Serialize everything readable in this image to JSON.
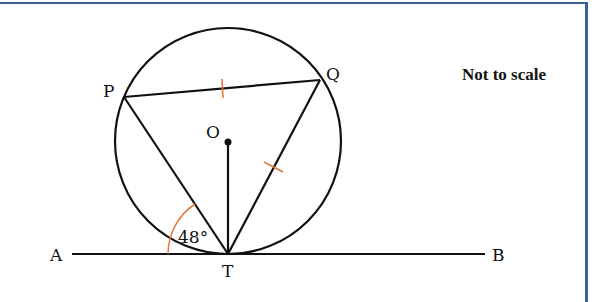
{
  "diagram": {
    "type": "circle-geometry",
    "note": "Not to scale",
    "points": {
      "P": {
        "label": "P"
      },
      "Q": {
        "label": "Q"
      },
      "O": {
        "label": "O"
      },
      "T": {
        "label": "T"
      },
      "A": {
        "label": "A"
      },
      "B": {
        "label": "B"
      }
    },
    "angle": {
      "label": "48°",
      "between": [
        "AT",
        "TP"
      ]
    },
    "equal_marks": [
      "PQ",
      "QT"
    ],
    "colors": {
      "border": "#3a5f9a",
      "lines": "#111111",
      "marks": "#e07a3a"
    }
  }
}
